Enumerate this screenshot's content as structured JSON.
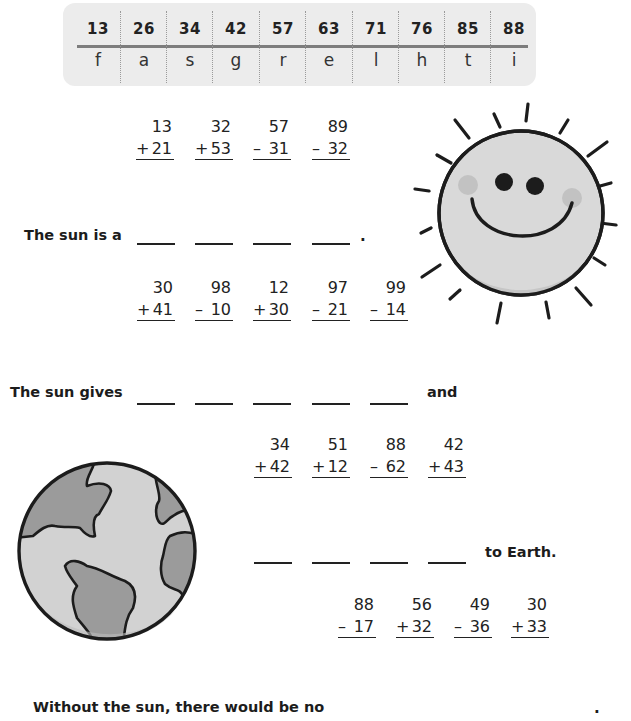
{
  "worksheet": {
    "key_table": {
      "numbers": [
        "13",
        "26",
        "34",
        "42",
        "57",
        "63",
        "71",
        "76",
        "85",
        "88"
      ],
      "letters": [
        "f",
        "a",
        "s",
        "g",
        "r",
        "e",
        "l",
        "h",
        "t",
        "i"
      ]
    },
    "sections": [
      {
        "problems": [
          {
            "top": "13",
            "op": "+",
            "bottom": "21"
          },
          {
            "top": "32",
            "op": "+",
            "bottom": "53"
          },
          {
            "top": "57",
            "op": "–",
            "bottom": "31"
          },
          {
            "top": "89",
            "op": "–",
            "bottom": "32"
          }
        ],
        "sentence_prefix": "The sun is a",
        "blank_count": 4,
        "sentence_suffix": "."
      },
      {
        "problems": [
          {
            "top": "30",
            "op": "+",
            "bottom": "41"
          },
          {
            "top": "98",
            "op": "–",
            "bottom": "10"
          },
          {
            "top": "12",
            "op": "+",
            "bottom": "30"
          },
          {
            "top": "97",
            "op": "–",
            "bottom": "21"
          },
          {
            "top": "99",
            "op": "–",
            "bottom": "14"
          }
        ],
        "sentence_prefix": "The sun gives",
        "blank_count": 5,
        "sentence_suffix": "and"
      },
      {
        "problems": [
          {
            "top": "34",
            "op": "+",
            "bottom": "42"
          },
          {
            "top": "51",
            "op": "+",
            "bottom": "12"
          },
          {
            "top": "88",
            "op": "–",
            "bottom": "62"
          },
          {
            "top": "42",
            "op": "+",
            "bottom": "43"
          }
        ],
        "blank_count": 4,
        "sentence_suffix": "to Earth."
      },
      {
        "problems": [
          {
            "top": "88",
            "op": "–",
            "bottom": "17"
          },
          {
            "top": "56",
            "op": "+",
            "bottom": "32"
          },
          {
            "top": "49",
            "op": "–",
            "bottom": "36"
          },
          {
            "top": "30",
            "op": "+",
            "bottom": "33"
          }
        ],
        "sentence_prefix": "Without the sun, there would be no",
        "sentence_suffix": "."
      }
    ],
    "illustrations": {
      "sun": "smiling-sun",
      "earth": "earth-globe"
    },
    "colors": {
      "key_bg": "#ececec",
      "key_rule": "#7d7d7d",
      "ink": "#1c1c1c",
      "sun_fill": "#d9d9d9",
      "earth_water": "#d2d2d2",
      "earth_land": "#9b9b9b"
    }
  }
}
